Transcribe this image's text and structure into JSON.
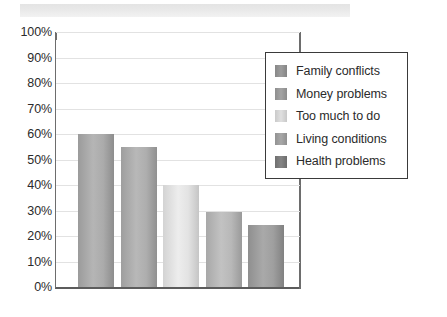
{
  "chart_data": {
    "type": "bar",
    "title": "",
    "subtitle": "",
    "xlabel": "",
    "ylabel": "",
    "ylim": [
      0,
      100
    ],
    "grid": true,
    "legend_position": "inside-top-right",
    "categories": [
      "Family conflicts",
      "Money problems",
      "Too much to do",
      "Living conditions",
      "Health problems"
    ],
    "values": [
      60,
      55,
      40,
      29.5,
      24.5
    ],
    "value_labels": [
      "60%",
      "55%",
      "40%",
      "29.5%",
      "24.5%"
    ],
    "ytick_labels": [
      "100%",
      "90%",
      "80%",
      "70%",
      "60%",
      "50%",
      "40%",
      "30%",
      "20%",
      "10%",
      "0%"
    ],
    "ytick_values": [
      100,
      90,
      80,
      70,
      60,
      50,
      40,
      30,
      20,
      10,
      0
    ],
    "xtick_labels": [
      "",
      "",
      "",
      "",
      ""
    ],
    "bar_colors": [
      "#9b9b9b",
      "#9e9e9e",
      "#d3d3d3",
      "#a8a8a8",
      "#8f8f8f"
    ],
    "series_name": "Percentage"
  },
  "legend": {
    "items": [
      {
        "label": "Family conflicts",
        "color": "#8f8f8f"
      },
      {
        "label": "Money problems",
        "color": "#969696"
      },
      {
        "label": "Too much to do",
        "color": "#d2d2d2"
      },
      {
        "label": "Living conditions",
        "color": "#9a9a9a"
      },
      {
        "label": "Health problems",
        "color": "#777777"
      }
    ]
  },
  "banner": {
    "color": "#e9e9e9"
  },
  "axis": {
    "line_color": "#6d6d6d",
    "grid_color": "#e2e2e2",
    "baseline_color": "#5c5c5c"
  }
}
